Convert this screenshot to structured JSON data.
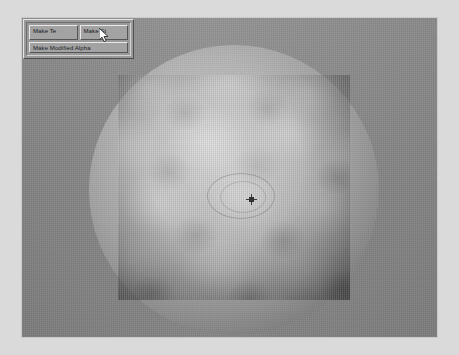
{
  "app": {
    "background_color": "#dadada",
    "viewport_color": "#8b8b8b"
  },
  "panel": {
    "name": "texture-tool-panel",
    "buttons": [
      {
        "id": "make-te",
        "label": "Make Te"
      },
      {
        "id": "make-st",
        "label": "Make St"
      },
      {
        "id": "make-modified-alpha",
        "label": "Make Modified Alpha"
      }
    ]
  },
  "viewport": {
    "name": "render-viewport",
    "sphere": {
      "label": "sphere-preview"
    },
    "texture_quad": {
      "label": "texture-quad-overlay"
    },
    "marker": {
      "label": "center-crosshair-marker"
    }
  },
  "cursor": {
    "label": "mouse-pointer",
    "x": 99,
    "y": 28
  }
}
